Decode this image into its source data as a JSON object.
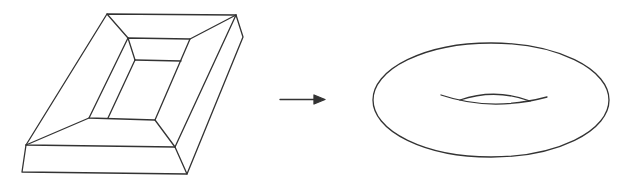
{
  "figure": {
    "description": "A framed rectangular solid with a hole transforms into a torus",
    "left_shape": "picture-frame-solid",
    "arrow": "right-arrow",
    "right_shape": "torus",
    "stroke_color": "#333333",
    "background": "#ffffff"
  }
}
